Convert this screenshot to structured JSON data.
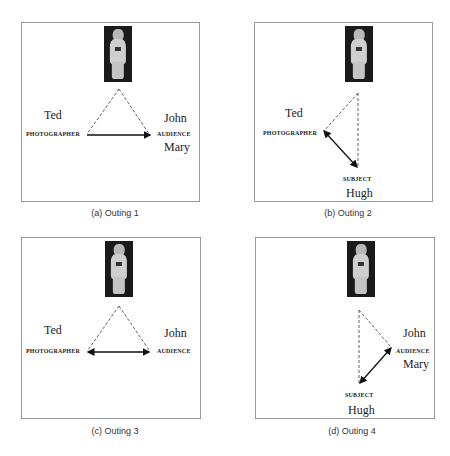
{
  "panels": [
    {
      "caption": "(a) Outing 1",
      "names": {
        "photographer": "Ted",
        "audience_1": "John",
        "audience_2": "Mary"
      },
      "roles": {
        "photographer": "PHOTOGRAPHER",
        "audience": "AUDIENCE"
      }
    },
    {
      "caption": "(b) Outing 2",
      "names": {
        "photographer": "Ted",
        "subject": "Hugh"
      },
      "roles": {
        "photographer": "PHOTOGRAPHER",
        "subject": "SUBJECT"
      }
    },
    {
      "caption": "(c) Outing 3",
      "names": {
        "photographer": "Ted",
        "audience_1": "John"
      },
      "roles": {
        "photographer": "PHOTOGRAPHER",
        "audience": "AUDIENCE"
      }
    },
    {
      "caption": "(d) Outing 4",
      "names": {
        "audience_1": "John",
        "audience_2": "Mary",
        "subject": "Hugh"
      },
      "roles": {
        "audience": "AUDIENCE",
        "subject": "SUBJECT"
      }
    }
  ]
}
